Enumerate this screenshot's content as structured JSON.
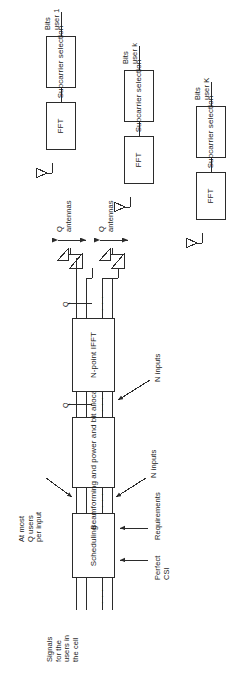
{
  "diagram": {
    "orientation": "rotated-90",
    "blocks": {
      "scheduling": "Scheduling",
      "beamforming": "Beamforming\nand power and\nbit allocation",
      "ifft": "N-point\nIFFT",
      "fft": "FFT",
      "subcarrier": "Subcarrier\nselection"
    },
    "receiver_chains": [
      {
        "id": "user1",
        "fft": "FFT",
        "subcarrier": "Subcarrier\nselection",
        "output": "Bits\nuser 1"
      },
      {
        "id": "userk",
        "fft": "FFT",
        "subcarrier": "Subcarrier\nselection",
        "output": "Bits\nuser k"
      },
      {
        "id": "userK",
        "fft": "FFT",
        "subcarrier": "Subcarrier\nselection",
        "output": "Bits\nuser K"
      }
    ],
    "annotations": {
      "input_signals": "Signals\nfor the\nusers in\nthe cell",
      "perfect_csi": "Perfect\nCSI",
      "requirements": "Requirements",
      "n_inputs_lower": "N inputs",
      "n_inputs_upper": "N inputs",
      "at_most": "At most\nQ users\nper input",
      "q_antennas_1": "Q\nantennas",
      "q_antennas_2": "Q\nantennas",
      "q_marker_1": "Q",
      "q_marker_2": "Q",
      "q_marker_3": "Q",
      "ellipsis": "· · ·"
    },
    "colors": {
      "stroke": "#2b2b2b",
      "text": "#1a1a1a",
      "background": "#ffffff"
    }
  }
}
